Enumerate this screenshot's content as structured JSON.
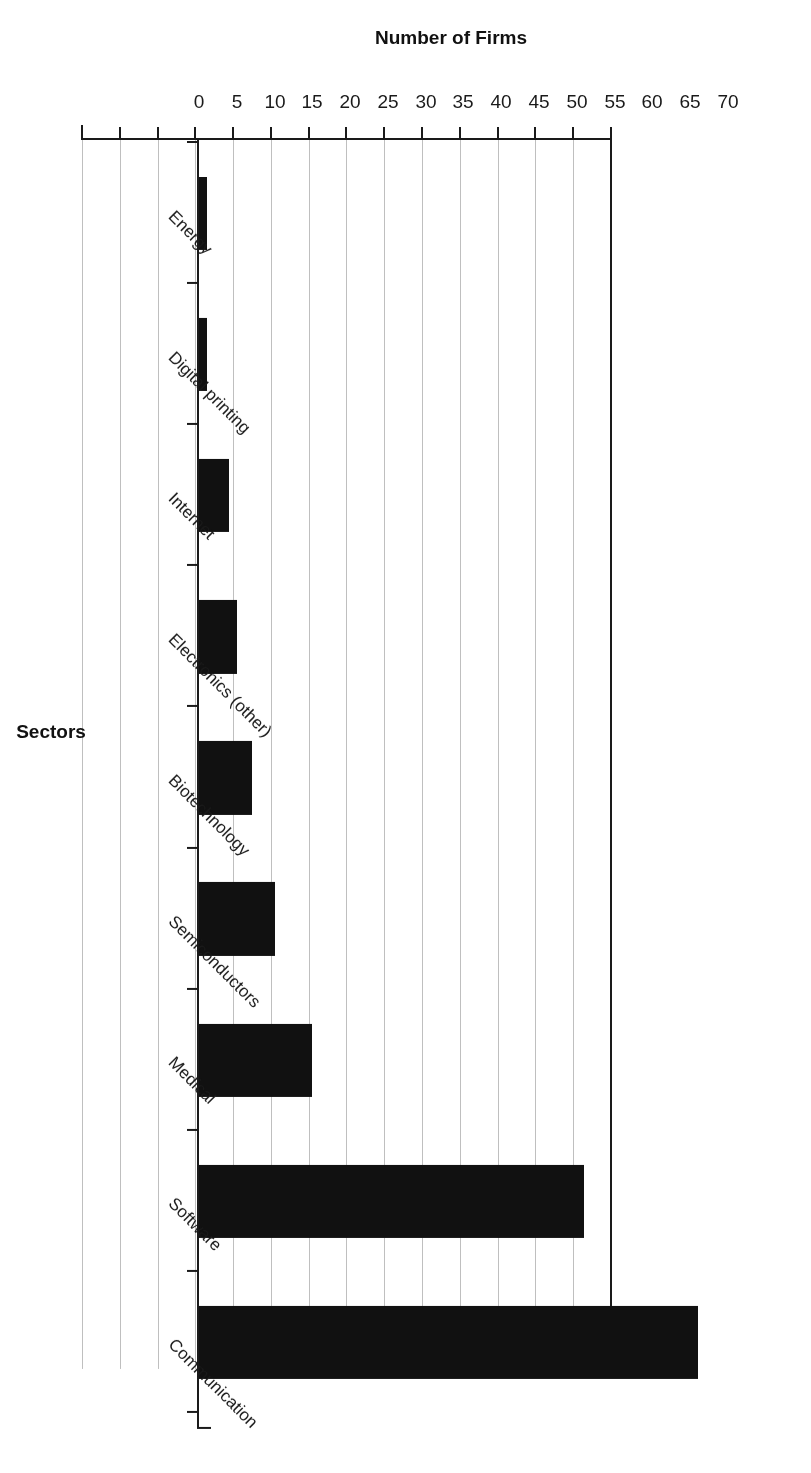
{
  "chart_data": {
    "type": "bar",
    "orientation": "vertical",
    "title": "",
    "xlabel": "Sectors",
    "ylabel": "Number of Firms",
    "categories": [
      "Communication",
      "Software",
      "Medical",
      "Semiconductors",
      "Biotechnology",
      "Electronics (other)",
      "Internet",
      "Digital printing",
      "Energy"
    ],
    "values": [
      66,
      51,
      15,
      10,
      7,
      5,
      4,
      1,
      1
    ],
    "ylim": [
      0,
      70
    ],
    "ytick_labels": [
      "0",
      "5",
      "10",
      "15",
      "20",
      "25",
      "30",
      "35",
      "40",
      "45",
      "50",
      "55",
      "60",
      "65",
      "70"
    ],
    "ytick_values": [
      0,
      5,
      10,
      15,
      20,
      25,
      30,
      35,
      40,
      45,
      50,
      55,
      60,
      65,
      70
    ],
    "grid": true,
    "grid_axis": "value",
    "legend": false,
    "bar_color": "#111111",
    "grid_color": "#bfbfbf",
    "axis_color": "#1a1a1a",
    "background_color": "#ffffff",
    "rotation_degrees": 180
  }
}
